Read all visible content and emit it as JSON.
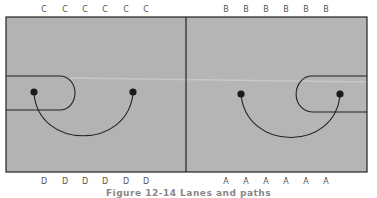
{
  "diagram": {
    "type": "court-play-diagram",
    "top_labels_left": [
      "C",
      "C",
      "C",
      "C",
      "C",
      "C"
    ],
    "top_labels_right": [
      "B",
      "B",
      "B",
      "B",
      "B",
      "B"
    ],
    "bottom_labels_left": [
      "D",
      "D",
      "D",
      "D",
      "D",
      "D"
    ],
    "bottom_labels_right": [
      "A",
      "A",
      "A",
      "A",
      "A",
      "A"
    ],
    "caption": "Figure 12-14  Lanes and paths",
    "colors": {
      "court_fill": "#b3b3b3",
      "line": "#222222",
      "dot": "#1a1a1a",
      "label": "#555555"
    }
  }
}
